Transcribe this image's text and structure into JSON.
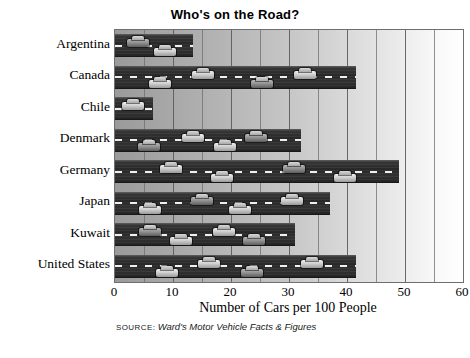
{
  "chart_data": {
    "type": "bar",
    "orientation": "horizontal",
    "title": "Who's on the Road?",
    "xlabel": "Number of Cars per 100 People",
    "ylabel": "",
    "xlim": [
      0,
      60
    ],
    "xticks": [
      0,
      10,
      20,
      30,
      40,
      50,
      60
    ],
    "xtick_labels": [
      "0",
      "10",
      "20",
      "30",
      "40",
      "50",
      "60"
    ],
    "grid": true,
    "gridline_interval": 5,
    "legend": null,
    "categories": [
      "Argentina",
      "Canada",
      "Chile",
      "Denmark",
      "Germany",
      "Japan",
      "Kuwait",
      "United States"
    ],
    "values": [
      13.5,
      41.5,
      6.5,
      32,
      49,
      37,
      31,
      41.5
    ],
    "series": [
      {
        "name": "Cars per 100 people",
        "values": [
          13.5,
          41.5,
          6.5,
          32,
          49,
          37,
          31,
          41.5
        ]
      }
    ],
    "source_label": "SOURCE:",
    "source_text": "Ward's Motor Vehicle Facts & Figures",
    "colors": {
      "bar": "#2d2d2d",
      "lane_marking": "#f0f0e6",
      "gridline": "#6e6e6e",
      "plot_border": "#6f6f6f",
      "text": "#000000",
      "background": "#ffffff"
    }
  }
}
